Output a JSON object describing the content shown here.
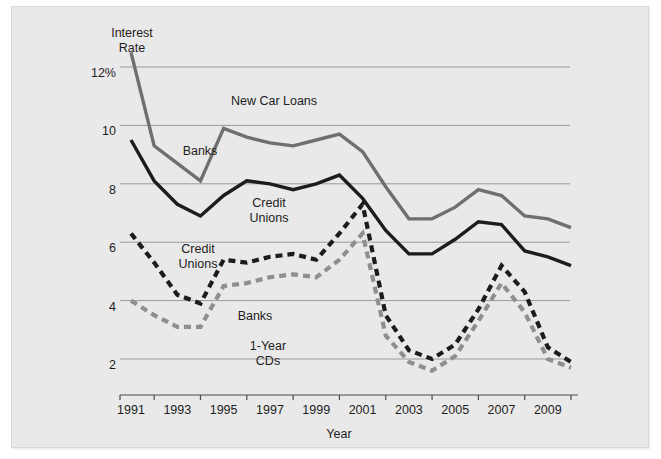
{
  "chart_data": {
    "type": "line",
    "title": "New Car Loans",
    "xlabel": "Year",
    "ylabel": "Interest Rate",
    "ylabel_lines": "Interest\nRate",
    "xlim": [
      1991,
      2010
    ],
    "ylim": [
      1.2,
      12.6
    ],
    "grid": true,
    "grid_axis": "y",
    "legend_position": "inline-annotations",
    "y_ticks": [
      {
        "value": 12,
        "label": "12%"
      },
      {
        "value": 10,
        "label": "10"
      },
      {
        "value": 8,
        "label": "8"
      },
      {
        "value": 6,
        "label": "6"
      },
      {
        "value": 4,
        "label": "4"
      },
      {
        "value": 2,
        "label": "2"
      }
    ],
    "x_ticks_labeled": [
      "1991",
      "1993",
      "1995",
      "1997",
      "1999",
      "2001",
      "2003",
      "2005",
      "2007",
      "2009"
    ],
    "x_tick_values_labeled": [
      1991,
      1993,
      1995,
      1997,
      1999,
      2001,
      2003,
      2005,
      2007,
      2009
    ],
    "x_tick_values_minor": [
      1992,
      1994,
      1996,
      1998,
      2000,
      2002,
      2004,
      2006,
      2008,
      2010
    ],
    "x": [
      1991,
      1992,
      1993,
      1994,
      1995,
      1996,
      1997,
      1998,
      1999,
      2000,
      2001,
      2002,
      2003,
      2004,
      2005,
      2006,
      2007,
      2008,
      2009,
      2010
    ],
    "series": [
      {
        "name": "New Car Loans - Banks",
        "label": "Banks",
        "style": "solid",
        "color": "#6f6f6f",
        "values": [
          12.5,
          9.3,
          8.7,
          8.1,
          9.9,
          9.6,
          9.4,
          9.3,
          9.5,
          9.7,
          9.1,
          7.9,
          6.8,
          6.8,
          7.2,
          7.8,
          7.6,
          6.9,
          6.8,
          6.5
        ]
      },
      {
        "name": "New Car Loans - Credit Unions",
        "label": "Credit\nUnions",
        "style": "solid",
        "color": "#1c1c1c",
        "values": [
          9.5,
          8.1,
          7.3,
          6.9,
          7.6,
          8.1,
          8.0,
          7.8,
          8.0,
          8.3,
          7.5,
          6.4,
          5.6,
          5.6,
          6.1,
          6.7,
          6.6,
          5.7,
          5.5,
          5.2
        ]
      },
      {
        "name": "1-Year CDs - Credit Unions",
        "label": "Credit\nUnions",
        "style": "dashed",
        "color": "#1c1c1c",
        "values": [
          6.3,
          5.3,
          4.2,
          3.9,
          5.4,
          5.3,
          5.5,
          5.6,
          5.4,
          6.3,
          7.3,
          3.5,
          2.3,
          2.0,
          2.5,
          3.7,
          5.2,
          4.3,
          2.4,
          1.9
        ]
      },
      {
        "name": "1-Year CDs - Banks",
        "label": "Banks",
        "style": "dashed",
        "color": "#8f8f8f",
        "values": [
          4.0,
          3.5,
          3.1,
          3.1,
          4.5,
          4.6,
          4.8,
          4.9,
          4.8,
          5.4,
          6.3,
          2.8,
          1.9,
          1.6,
          2.1,
          3.3,
          4.6,
          3.6,
          2.0,
          1.7
        ]
      }
    ],
    "annotations": [
      {
        "text": "New Car Loans",
        "x_px": 262,
        "y_px": 95
      },
      {
        "text": "Banks",
        "x_px": 188,
        "y_px": 145
      },
      {
        "text": "Credit\nUnions",
        "x_px": 257,
        "y_px": 197
      },
      {
        "text": "Credit\nUnions",
        "x_px": 186,
        "y_px": 243
      },
      {
        "text": "Banks",
        "x_px": 243,
        "y_px": 310
      },
      {
        "text": "1-Year\nCDs",
        "x_px": 256,
        "y_px": 340
      }
    ]
  },
  "colors": {
    "plate_background": "#e9e9e9",
    "page_background": "#ffffff",
    "gridline": "#9a9a9a",
    "axis": "#4a4a4a",
    "text": "#1d1d1d",
    "series_banks_loans": "#6f6f6f",
    "series_cu_loans": "#1c1c1c",
    "series_cu_cds": "#1c1c1c",
    "series_banks_cds": "#8f8f8f"
  }
}
